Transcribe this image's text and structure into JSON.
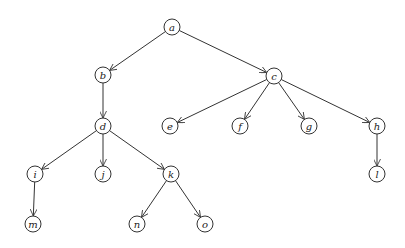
{
  "diagram": {
    "type": "tree",
    "directed": true,
    "node_radius": 8,
    "nodes": [
      {
        "id": "a",
        "label": "a",
        "x": 172,
        "y": 27
      },
      {
        "id": "b",
        "label": "b",
        "x": 103,
        "y": 75
      },
      {
        "id": "c",
        "label": "c",
        "x": 274,
        "y": 76
      },
      {
        "id": "d",
        "label": "d",
        "x": 103,
        "y": 126
      },
      {
        "id": "e",
        "label": "e",
        "x": 170,
        "y": 126
      },
      {
        "id": "f",
        "label": "f",
        "x": 240,
        "y": 126
      },
      {
        "id": "g",
        "label": "g",
        "x": 309,
        "y": 126
      },
      {
        "id": "h",
        "label": "h",
        "x": 377,
        "y": 126
      },
      {
        "id": "i",
        "label": "i",
        "x": 35,
        "y": 174
      },
      {
        "id": "j",
        "label": "j",
        "x": 103,
        "y": 174
      },
      {
        "id": "k",
        "label": "k",
        "x": 171,
        "y": 174
      },
      {
        "id": "l",
        "label": "l",
        "x": 377,
        "y": 174
      },
      {
        "id": "m",
        "label": "m",
        "x": 33,
        "y": 224
      },
      {
        "id": "n",
        "label": "n",
        "x": 137,
        "y": 224
      },
      {
        "id": "o",
        "label": "o",
        "x": 205,
        "y": 224
      }
    ],
    "edges": [
      {
        "from": "a",
        "to": "b"
      },
      {
        "from": "a",
        "to": "c"
      },
      {
        "from": "b",
        "to": "d"
      },
      {
        "from": "c",
        "to": "e"
      },
      {
        "from": "c",
        "to": "f"
      },
      {
        "from": "c",
        "to": "g"
      },
      {
        "from": "c",
        "to": "h"
      },
      {
        "from": "d",
        "to": "i"
      },
      {
        "from": "d",
        "to": "j"
      },
      {
        "from": "d",
        "to": "k"
      },
      {
        "from": "h",
        "to": "l"
      },
      {
        "from": "i",
        "to": "m"
      },
      {
        "from": "k",
        "to": "n"
      },
      {
        "from": "k",
        "to": "o"
      }
    ],
    "colors": {
      "stroke": "#333333",
      "fill": "#ffffff",
      "text": "#222222"
    }
  }
}
